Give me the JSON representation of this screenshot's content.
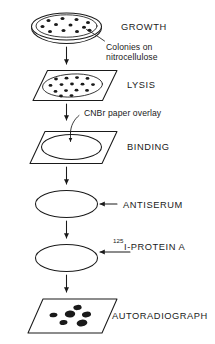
{
  "diagram": {
    "background_color": "#ffffff",
    "ink_color": "#1a1a1a",
    "stages": [
      {
        "id": "growth",
        "label": "GROWTH",
        "vessel": "petri-dish",
        "colony_count": 12,
        "callout": "Colonies on nitrocellulose"
      },
      {
        "id": "lysis",
        "label": "LYSIS",
        "vessel": "filter-sheet-with-colonies",
        "colony_count": 15
      },
      {
        "id": "binding",
        "label": "BINDING",
        "vessel": "filter-sheet-blank",
        "callout": "CNBr paper overlay"
      },
      {
        "id": "antiserum",
        "label": "ANTISERUM",
        "vessel": "disc",
        "reagent_arrow": true
      },
      {
        "id": "protein-a",
        "label_superscript": "125",
        "label": "I-PROTEIN A",
        "vessel": "disc",
        "reagent_arrow": true
      },
      {
        "id": "autoradiograph",
        "label": "AUTORADIOGRAPH",
        "vessel": "film-sheet-with-spots",
        "spot_count": 6
      }
    ],
    "flow_arrows": 5,
    "arrow_direction": "down"
  }
}
